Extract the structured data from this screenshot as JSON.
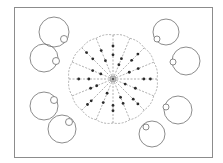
{
  "diagram": {
    "frame": {
      "x": 14,
      "y": 7,
      "width": 198,
      "height": 150,
      "stroke": "#8c8c8c"
    },
    "wheel": {
      "center": [
        113,
        79
      ],
      "outer_radius": 44,
      "spoke_count": 16,
      "spoke_color": "#9a9a9a",
      "dot_color": "#2a2a2a",
      "hub_radius": 3,
      "dots": [
        [
          0.55,
          0.75
        ],
        [
          0.35,
          0.5
        ],
        [
          0.6,
          0.8
        ],
        [
          0.4,
          0.62
        ],
        [
          0.7,
          0.85
        ],
        [
          0.3,
          0.55
        ],
        [
          0.65,
          0.8
        ],
        [
          0.45,
          0.6
        ],
        [
          0.6,
          0.72
        ],
        [
          0.35,
          0.58
        ],
        [
          0.7,
          0.82
        ],
        [
          0.4,
          0.55
        ],
        [
          0.55,
          0.78
        ],
        [
          0.3,
          0.5
        ],
        [
          0.65,
          0.85
        ],
        [
          0.45,
          0.7
        ]
      ]
    },
    "circles": [
      {
        "name": "circle-top-left-1",
        "cx": 54,
        "cy": 32,
        "r": 15,
        "bx": 64,
        "by": 39,
        "br": 3.5
      },
      {
        "name": "circle-top-left-2",
        "cx": 44,
        "cy": 58,
        "r": 14,
        "bx": 56,
        "by": 61,
        "br": 3.5
      },
      {
        "name": "circle-bottom-left-1",
        "cx": 44,
        "cy": 106,
        "r": 14,
        "bx": 54,
        "by": 100,
        "br": 3.5
      },
      {
        "name": "circle-bottom-left-2",
        "cx": 62,
        "cy": 129,
        "r": 14,
        "bx": 69,
        "by": 122,
        "br": 3.5
      },
      {
        "name": "circle-top-right-1",
        "cx": 166,
        "cy": 32,
        "r": 13,
        "bx": 157,
        "by": 39,
        "br": 3
      },
      {
        "name": "circle-top-right-2",
        "cx": 186,
        "cy": 61,
        "r": 14,
        "bx": 173,
        "by": 62,
        "br": 3
      },
      {
        "name": "circle-bottom-right-1",
        "cx": 178,
        "cy": 110,
        "r": 14,
        "bx": 166,
        "by": 107,
        "br": 3
      },
      {
        "name": "circle-bottom-right-2",
        "cx": 152,
        "cy": 134,
        "r": 13,
        "bx": 146,
        "by": 127,
        "br": 3
      }
    ]
  }
}
